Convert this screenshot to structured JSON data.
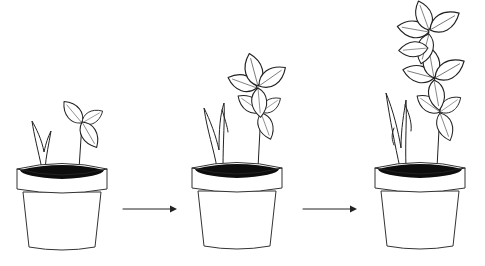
{
  "figure": {
    "description": "Plant growth sequence in three pots",
    "stages": [
      {
        "label": "Stage 1 - seedling",
        "pot_x": 16
      },
      {
        "label": "Stage 2 - young plant",
        "pot_x": 191
      },
      {
        "label": "Stage 3 - grown plant",
        "pot_x": 374
      }
    ],
    "arrows": [
      {
        "from": "stage-1",
        "to": "stage-2"
      },
      {
        "from": "stage-2",
        "to": "stage-3"
      }
    ],
    "colors": {
      "line": "#222222",
      "soil": "#0d0d0d",
      "background": "#ffffff"
    }
  }
}
